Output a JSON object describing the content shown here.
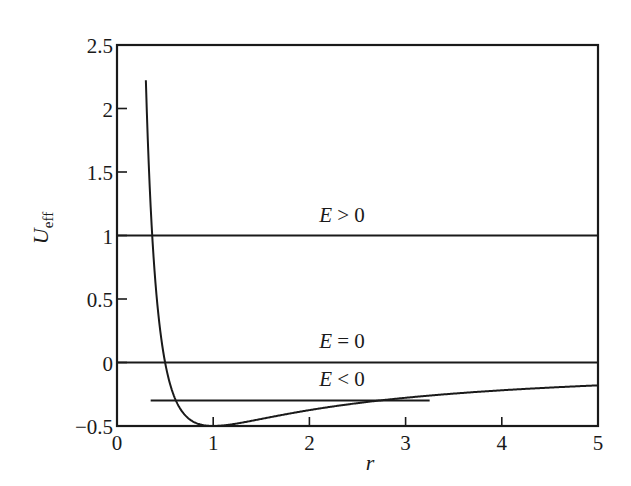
{
  "chart_data": {
    "type": "line",
    "title": "",
    "xlabel": "r",
    "ylabel": "U_eff",
    "ylabel_main": "U",
    "ylabel_sub": "eff",
    "xlim": [
      0,
      5
    ],
    "ylim": [
      -0.5,
      2.5
    ],
    "grid": false,
    "legend": null,
    "x_ticks": [
      0,
      1,
      2,
      3,
      4,
      5
    ],
    "x_tick_labels": [
      "0",
      "1",
      "2",
      "3",
      "4",
      "5"
    ],
    "y_ticks": [
      -0.5,
      0,
      0.5,
      1,
      1.5,
      2,
      2.5
    ],
    "y_tick_labels": [
      "−0.5",
      "0",
      "0.5",
      "1",
      "1.5",
      "2",
      "2.5"
    ],
    "series": [
      {
        "name": "U_eff(r)",
        "formula": "1/(2r^2) - 1/r",
        "x": [
          0.3,
          0.35,
          0.4,
          0.45,
          0.5,
          0.6,
          0.7,
          0.8,
          1.0,
          1.25,
          1.5,
          2.0,
          2.5,
          3.0,
          3.5,
          4.0,
          4.5,
          5.0
        ],
        "values": [
          2.22,
          1.22,
          0.63,
          0.25,
          0.0,
          -0.28,
          -0.41,
          -0.47,
          -0.5,
          -0.48,
          -0.44,
          -0.375,
          -0.32,
          -0.28,
          -0.245,
          -0.22,
          -0.198,
          -0.18
        ]
      },
      {
        "name": "E > 0",
        "x": [
          0,
          5
        ],
        "values": [
          1,
          1
        ]
      },
      {
        "name": "E = 0",
        "x": [
          0,
          5
        ],
        "values": [
          0,
          0
        ]
      },
      {
        "name": "E < 0",
        "x": [
          0.35,
          3.25
        ],
        "values": [
          -0.3,
          -0.3
        ]
      }
    ],
    "annotations": [
      {
        "text": "E > 0",
        "x": 2.3,
        "y": 1.12
      },
      {
        "text": "E = 0",
        "x": 2.3,
        "y": 0.12
      },
      {
        "text": "E < 0",
        "x": 2.3,
        "y": -0.18
      }
    ]
  },
  "labels": {
    "e_pos_var": "E",
    "e_pos_rest": " > 0",
    "e_zero_var": "E",
    "e_zero_rest": " = 0",
    "e_neg_var": "E",
    "e_neg_rest": " < 0"
  }
}
